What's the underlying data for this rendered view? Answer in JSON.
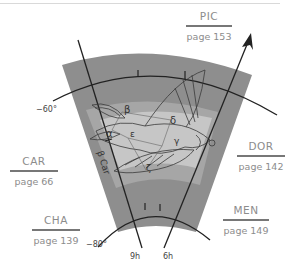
{
  "diagram": {
    "constellation_labels": [
      {
        "id": "pic",
        "abbr": "PIC",
        "page": "page 153"
      },
      {
        "id": "car",
        "abbr": "CAR",
        "page": "page 66"
      },
      {
        "id": "dor",
        "abbr": "DOR",
        "page": "page 142"
      },
      {
        "id": "cha",
        "abbr": "CHA",
        "page": "page 139"
      },
      {
        "id": "men",
        "abbr": "MEN",
        "page": "page 149"
      }
    ],
    "declination_labels": {
      "upper": "−60°",
      "lower": "−80°"
    },
    "ra_labels": {
      "left": "9h",
      "right": "6h"
    },
    "star_labels": {
      "alpha": "α",
      "beta": "β",
      "gamma": "γ",
      "delta": "δ",
      "epsilon": "ε",
      "zeta": "ζ",
      "beta_car": "β Car"
    },
    "colors": {
      "outer_region": "#8e8e8e",
      "middle_band": "#a6a6a6",
      "inner_region": "#c6c6c6",
      "line": "#222222",
      "label_text": "#8c8c8c"
    }
  }
}
